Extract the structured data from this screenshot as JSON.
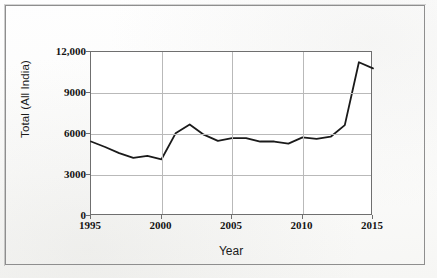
{
  "figure": {
    "y_axis_title": "Total (All India)",
    "x_axis_title": "Year"
  },
  "chart_data": {
    "type": "line",
    "title": "",
    "xlabel": "Year",
    "ylabel": "Total (All India)",
    "xlim": [
      1995,
      2015
    ],
    "ylim": [
      0,
      12000
    ],
    "xticks": [
      "1995",
      "2000",
      "2005",
      "2010",
      "2015"
    ],
    "xtick_values": [
      1995,
      2000,
      2005,
      2010,
      2015
    ],
    "yticks": [
      "0",
      "3000",
      "6000",
      "9000",
      "12,000"
    ],
    "ytick_values": [
      0,
      3000,
      6000,
      9000,
      12000
    ],
    "grid": "both",
    "legend": "none",
    "line_color": "#1a1a1a",
    "x": [
      1995,
      1996,
      1997,
      1998,
      1999,
      2000,
      2001,
      2002,
      2003,
      2004,
      2005,
      2006,
      2007,
      2008,
      2009,
      2010,
      2011,
      2012,
      2013,
      2014,
      2015
    ],
    "series": [
      {
        "name": "Total (All India)",
        "values": [
          5450,
          5050,
          4600,
          4250,
          4400,
          4150,
          6050,
          6700,
          5950,
          5500,
          5700,
          5700,
          5450,
          5450,
          5300,
          5750,
          5650,
          5800,
          6650,
          11250,
          10800
        ]
      }
    ]
  }
}
